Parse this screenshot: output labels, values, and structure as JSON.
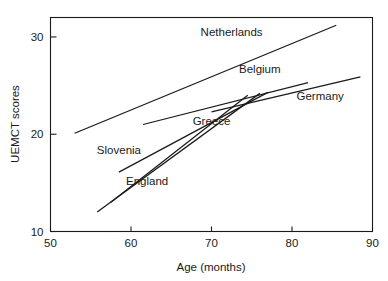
{
  "chart_data": {
    "type": "line",
    "title": "",
    "subtitle": "",
    "xlabel": "Age (months)",
    "ylabel": "UEMCT scores",
    "xlim": [
      50,
      90
    ],
    "ylim": [
      10,
      32
    ],
    "xticks": [
      50,
      60,
      70,
      80,
      90
    ],
    "yticks": [
      10,
      20,
      30
    ],
    "xtick_labels": [
      "50",
      "60",
      "70",
      "80",
      "90"
    ],
    "ytick_labels": [
      "10",
      "20",
      "30"
    ],
    "grid": false,
    "legend_position": "inline-annotations",
    "series": [
      {
        "name": "Netherlands",
        "x": [
          53.0,
          85.5
        ],
        "y": [
          20.1,
          31.2
        ],
        "label_x": 72.5,
        "label_y": 30.1
      },
      {
        "name": "Belgium",
        "x": [
          61.5,
          82.0
        ],
        "y": [
          21.0,
          25.3
        ],
        "label_x": 76.0,
        "label_y": 26.3
      },
      {
        "name": "Germany",
        "x": [
          70.0,
          88.5
        ],
        "y": [
          22.3,
          25.9
        ],
        "label_x": 83.5,
        "label_y": 23.5
      },
      {
        "name": "Greece",
        "x": [
          58.5,
          77.0
        ],
        "y": [
          16.1,
          24.3
        ],
        "label_x": 70.0,
        "label_y": 21.0
      },
      {
        "name": "Slovenia",
        "x": [
          57.5,
          74.5
        ],
        "y": [
          13.0,
          24.0
        ],
        "label_x": 58.5,
        "label_y": 18.0
      },
      {
        "name": "England",
        "x": [
          55.8,
          76.0
        ],
        "y": [
          12.0,
          24.2
        ],
        "label_x": 62.0,
        "label_y": 14.8
      }
    ]
  },
  "axes": {
    "x_title": "Age (months)",
    "y_title": "UEMCT scores"
  }
}
